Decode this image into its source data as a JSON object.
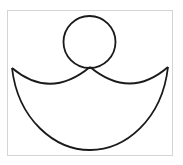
{
  "figure": {
    "stroke_color": "#1a1a1a",
    "frame_border_color": "#d4d4d4",
    "circle": {
      "cx": 89.5,
      "cy": 42,
      "r": 26
    },
    "cusp": {
      "x": 90,
      "y": 67
    },
    "left_tip": {
      "x": 12,
      "y": 68
    },
    "right_tip": {
      "x": 168,
      "y": 67
    },
    "bottom": {
      "x": 90,
      "y": 150
    }
  }
}
